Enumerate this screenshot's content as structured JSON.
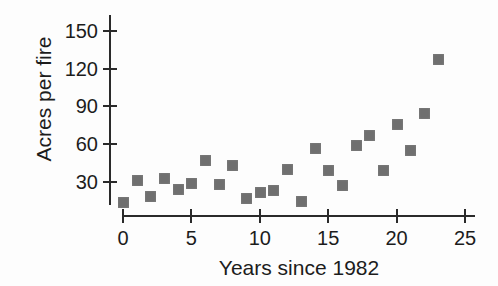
{
  "chart_data": {
    "type": "scatter",
    "xlabel": "Years since 1982",
    "ylabel": "Acres per fire",
    "x": [
      0,
      1,
      2,
      3,
      4,
      5,
      6,
      7,
      8,
      9,
      10,
      11,
      12,
      13,
      14,
      15,
      16,
      17,
      18,
      19,
      20,
      21,
      22,
      23
    ],
    "y": [
      14,
      31,
      19,
      33,
      24,
      29,
      47,
      28,
      43,
      17,
      22,
      23,
      40,
      15,
      57,
      39,
      27,
      59,
      67,
      39,
      76,
      55,
      85,
      128
    ],
    "xticks": [
      0,
      5,
      10,
      15,
      20,
      25
    ],
    "yticks": [
      30,
      60,
      90,
      120,
      150
    ],
    "xlim": [
      0,
      25
    ],
    "ylim": [
      0,
      160
    ],
    "grid": false,
    "legend": "none",
    "marker_shape": "square",
    "marker_color": "#6f6f6f",
    "axis_color": "#2a2a2a",
    "text_color": "#1c1c1c",
    "background_color": "#fdfdfd"
  }
}
